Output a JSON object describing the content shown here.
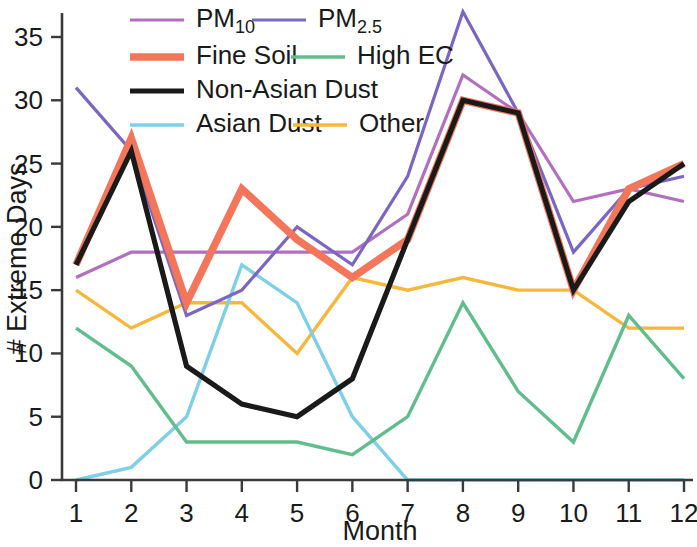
{
  "chart_data": {
    "type": "line",
    "title": "",
    "xlabel": "Month",
    "ylabel": "# Extreme Days",
    "x": [
      1,
      2,
      3,
      4,
      5,
      6,
      7,
      8,
      9,
      10,
      11,
      12
    ],
    "xtick_labels": [
      "1",
      "2",
      "3",
      "4",
      "5",
      "6",
      "7",
      "8",
      "9",
      "10",
      "11",
      "12"
    ],
    "ytick_labels": [
      "0",
      "5",
      "10",
      "15",
      "20",
      "25",
      "30",
      "35"
    ],
    "yticks": [
      0,
      5,
      10,
      15,
      20,
      25,
      30,
      35
    ],
    "xlim": [
      1,
      12
    ],
    "ylim": [
      0,
      37
    ],
    "grid": false,
    "legend_position": "top-left-inside",
    "series": [
      {
        "name": "PM10",
        "label_main": "PM",
        "label_sub": "10",
        "color": "#b26fc0",
        "width": 3.2,
        "values": [
          16,
          18,
          18,
          18,
          18,
          18,
          21,
          32,
          29,
          22,
          23,
          22
        ]
      },
      {
        "name": "PM2.5",
        "label_main": "PM",
        "label_sub": "2.5",
        "color": "#7b66c4",
        "width": 3.2,
        "values": [
          31,
          26,
          13,
          15,
          20,
          17,
          24,
          37,
          29,
          18,
          23,
          24
        ]
      },
      {
        "name": "Fine Soil",
        "label_main": "Fine Soil",
        "label_sub": "",
        "color": "#f4765a",
        "width": 7.5,
        "values": [
          17,
          27,
          14,
          23,
          19,
          16,
          19,
          30,
          29,
          15,
          23,
          25
        ]
      },
      {
        "name": "High EC",
        "label_main": "High EC",
        "label_sub": "",
        "color": "#62bd8c",
        "width": 3.4,
        "values": [
          12,
          9,
          3,
          3,
          3,
          2,
          5,
          14,
          7,
          3,
          13,
          8
        ]
      },
      {
        "name": "Non-Asian Dust",
        "label_main": "Non-Asian Dust",
        "label_sub": "",
        "color": "#1a1a1a",
        "width": 5.2,
        "values": [
          17,
          26,
          9,
          6,
          5,
          8,
          19,
          30,
          29,
          15,
          22,
          25
        ]
      },
      {
        "name": "Asian Dust",
        "label_main": "Asian Dust",
        "label_sub": "",
        "color": "#7ecfe8",
        "width": 3.4,
        "values": [
          0,
          1,
          5,
          17,
          14,
          5,
          0,
          0,
          0,
          0,
          0,
          0
        ]
      },
      {
        "name": "Other",
        "label_main": "Other",
        "label_sub": "",
        "color": "#f6b73c",
        "width": 3.4,
        "values": [
          15,
          12,
          14,
          14,
          10,
          16,
          15,
          16,
          15,
          15,
          12,
          12
        ]
      }
    ]
  },
  "axes": {
    "y_title": "# Extreme Days",
    "x_title": "Month"
  },
  "legend": {
    "rows": [
      [
        {
          "series": "PM10",
          "main": "PM",
          "sub": "10"
        },
        {
          "series": "PM2.5",
          "main": "PM",
          "sub": "2.5"
        }
      ],
      [
        {
          "series": "Fine Soil",
          "main": "Fine Soil",
          "sub": ""
        },
        {
          "series": "High EC",
          "main": "High EC",
          "sub": ""
        }
      ],
      [
        {
          "series": "Non-Asian Dust",
          "main": "Non-Asian Dust",
          "sub": ""
        }
      ],
      [
        {
          "series": "Asian Dust",
          "main": "Asian Dust",
          "sub": ""
        },
        {
          "series": "Other",
          "main": "Other",
          "sub": ""
        }
      ]
    ]
  }
}
